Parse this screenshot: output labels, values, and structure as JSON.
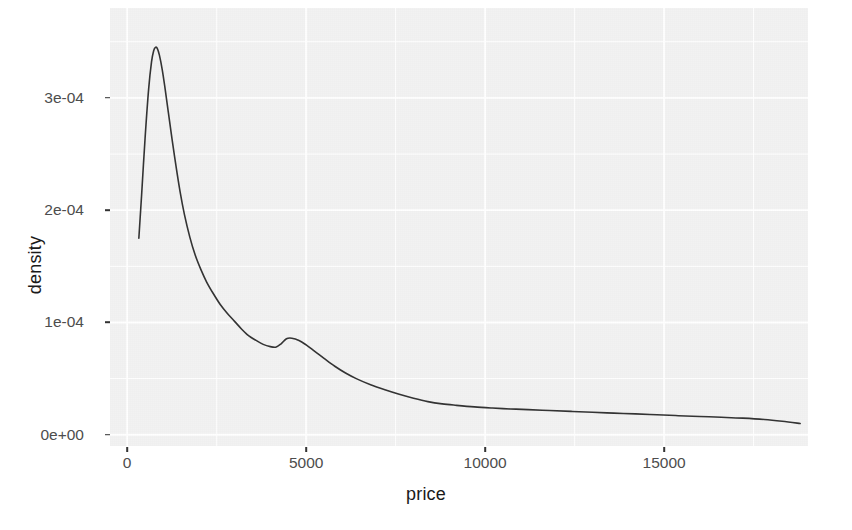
{
  "chart_data": {
    "type": "line",
    "title": "",
    "subtitle": "",
    "xlabel": "price",
    "ylabel": "density",
    "xlim": [
      -480,
      19020
    ],
    "ylim": [
      -1e-05,
      0.00038
    ],
    "grid": true,
    "legend": "none",
    "xticks": [
      {
        "value": 0,
        "label": "0"
      },
      {
        "value": 5000,
        "label": "5000"
      },
      {
        "value": 10000,
        "label": "10000"
      },
      {
        "value": 15000,
        "label": "15000"
      }
    ],
    "yticks": [
      {
        "value": 0.0,
        "label": "0e+00"
      },
      {
        "value": 0.0001,
        "label": "1e-04"
      },
      {
        "value": 0.0002,
        "label": "2e-04"
      },
      {
        "value": 0.0003,
        "label": "3e-04"
      }
    ],
    "minor_xticks": [
      2500,
      7500,
      12500,
      17500
    ],
    "minor_yticks": [
      5e-05,
      0.00015,
      0.00025,
      0.00035
    ],
    "series": [
      {
        "name": "density",
        "color": "#333333",
        "linewidth": 1.6,
        "x": [
          326,
          400,
          500,
          600,
          680,
          740,
          790,
          840,
          900,
          980,
          1060,
          1150,
          1250,
          1360,
          1480,
          1600,
          1750,
          1900,
          2060,
          2220,
          2400,
          2600,
          2800,
          3000,
          3200,
          3400,
          3600,
          3800,
          4000,
          4150,
          4300,
          4450,
          4600,
          4800,
          5000,
          5250,
          5500,
          5800,
          6100,
          6400,
          6800,
          7200,
          7600,
          8000,
          8400,
          8800,
          9200,
          9700,
          10200,
          10700,
          11200,
          11800,
          12400,
          13000,
          13600,
          14200,
          14800,
          15400,
          16000,
          16600,
          17200,
          17800,
          18300,
          18800
        ],
        "y": [
          0.000175,
          0.000212,
          0.000264,
          0.000308,
          0.000332,
          0.000342,
          0.000345,
          0.000344,
          0.000338,
          0.000325,
          0.000308,
          0.000287,
          0.000264,
          0.00024,
          0.000216,
          0.000196,
          0.000176,
          0.00016,
          0.000147,
          0.000136,
          0.000126,
          0.000116,
          0.000108,
          0.000101,
          9.4e-05,
          8.8e-05,
          8.4e-05,
          8.05e-05,
          7.85e-05,
          7.8e-05,
          8.1e-05,
          8.55e-05,
          8.6e-05,
          8.4e-05,
          8e-05,
          7.4e-05,
          6.8e-05,
          6.1e-05,
          5.5e-05,
          5e-05,
          4.45e-05,
          4e-05,
          3.6e-05,
          3.25e-05,
          2.95e-05,
          2.75e-05,
          2.62e-05,
          2.48e-05,
          2.38e-05,
          2.3e-05,
          2.24e-05,
          2.16e-05,
          2.08e-05,
          2e-05,
          1.93e-05,
          1.86e-05,
          1.78e-05,
          1.7e-05,
          1.63e-05,
          1.56e-05,
          1.48e-05,
          1.36e-05,
          1.2e-05,
          1e-05
        ]
      }
    ],
    "annotations": [],
    "peak": {
      "x": 790,
      "y": 3.45e-05,
      "label": ""
    },
    "local_min": {
      "x": 4150,
      "y": 7.8e-05,
      "label": ""
    },
    "local_max": {
      "x": 4450,
      "y": 8.6e-05,
      "label": ""
    }
  },
  "theme": {
    "panel_background": "#f2f2f2",
    "grid_color": "#ffffff",
    "line_color": "#333333",
    "tick_label_color": "#4d4d4d",
    "axis_title_color": "#1a1a1a",
    "figure_background": "#ffffff"
  }
}
